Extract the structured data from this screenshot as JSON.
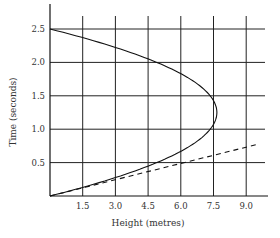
{
  "chart_data": {
    "type": "line",
    "title": "",
    "xlabel": "Height (metres)",
    "ylabel": "Time (seconds)",
    "xlim": [
      0,
      9.6
    ],
    "ylim": [
      0,
      2.8
    ],
    "grid": true,
    "x_ticks": [
      "1.5",
      "3.0",
      "4.5",
      "6.0",
      "7.5",
      "9.0"
    ],
    "y_ticks": [
      "0.5",
      "1.0",
      "1.5",
      "2.0",
      "2.5"
    ],
    "series": [
      {
        "name": "trajectory",
        "style": "solid",
        "points": [
          {
            "t": 0.0,
            "h": 0.0
          },
          {
            "t": 0.25,
            "h": 2.76
          },
          {
            "t": 0.5,
            "h": 4.9
          },
          {
            "t": 0.75,
            "h": 6.43
          },
          {
            "t": 1.0,
            "h": 7.35
          },
          {
            "t": 1.25,
            "h": 7.66
          },
          {
            "t": 1.5,
            "h": 7.35
          },
          {
            "t": 1.75,
            "h": 6.43
          },
          {
            "t": 2.0,
            "h": 4.9
          },
          {
            "t": 2.25,
            "h": 2.76
          },
          {
            "t": 2.5,
            "h": 0.0
          }
        ]
      },
      {
        "name": "tangent",
        "style": "dashed",
        "points": [
          {
            "t": 0.0,
            "h": 0.0
          },
          {
            "t": 0.78,
            "h": 9.6
          }
        ]
      }
    ]
  }
}
